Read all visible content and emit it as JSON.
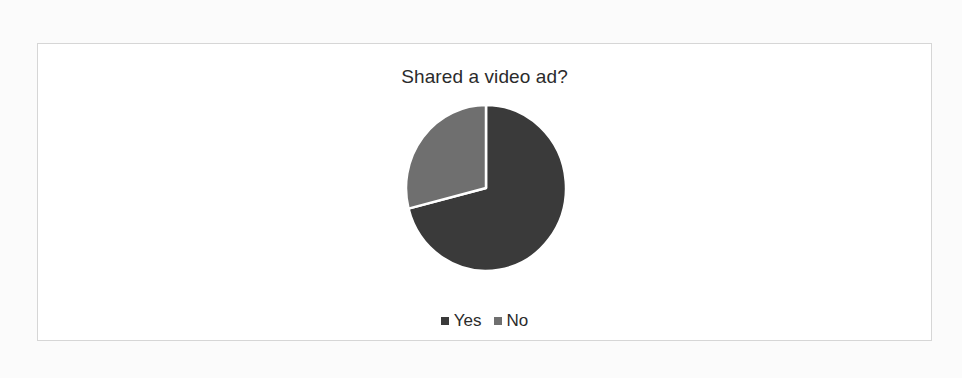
{
  "chart_data": {
    "type": "pie",
    "title": "Shared a video ad?",
    "categories": [
      "Yes",
      "No"
    ],
    "values": [
      71,
      29
    ],
    "units": "percent (estimated from slice angles)",
    "colors": [
      "#3a3a3a",
      "#6f6f6f"
    ],
    "legend": {
      "position": "bottom",
      "entries": [
        "Yes",
        "No"
      ]
    },
    "start_angle_deg": 0,
    "direction": "clockwise",
    "data_labels": false
  },
  "chart": {
    "title": "Shared a video ad?",
    "legend": [
      {
        "label": "Yes",
        "color": "#3a3a3a"
      },
      {
        "label": "No",
        "color": "#6f6f6f"
      }
    ]
  }
}
